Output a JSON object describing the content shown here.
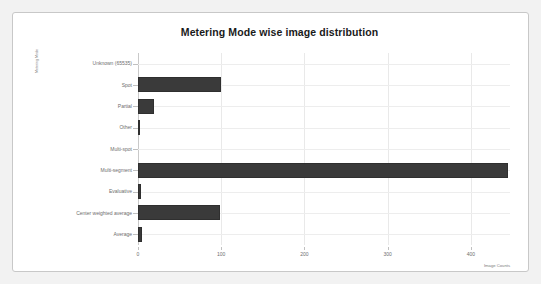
{
  "chart_data": {
    "type": "bar",
    "orientation": "horizontal",
    "title": "Metering Mode wise image distribution",
    "xlabel": "Image Counts",
    "ylabel": "Metering Mode",
    "categories": [
      "Unknown (65535)",
      "Spot",
      "Partial",
      "Other",
      "Multi-spot",
      "Multi-segment",
      "Evaluative",
      "Center weighted average",
      "Average"
    ],
    "values": [
      0,
      100,
      19,
      3,
      0,
      445,
      4,
      99,
      5
    ],
    "xlim": [
      0,
      447
    ],
    "xticks": [
      0,
      100,
      200,
      300,
      400
    ],
    "xticklabels": [
      "0",
      "100",
      "200",
      "300",
      "400"
    ],
    "grid": true,
    "legend": false,
    "bar_color": "#3a3a3a",
    "gridline_color": "#e9e9e9",
    "panel_background": "#ffffff",
    "figure_background": "#f2f2f2",
    "text_color": "#6e6e6e",
    "title_color": "#1a1a1a"
  }
}
